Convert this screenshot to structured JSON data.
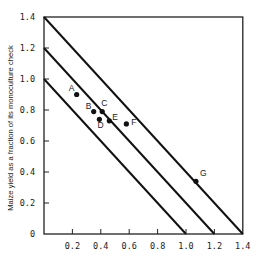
{
  "chart_data": {
    "type": "scatter",
    "title": "",
    "xlabel": "",
    "ylabel": "Maize yield as a fraction of its monoculture check",
    "xlim": [
      0,
      1.4
    ],
    "ylim": [
      0,
      1.4
    ],
    "grid": false,
    "legend": null,
    "x_ticks": [
      "0.2",
      "0.4",
      "0.6",
      "0.8",
      "1.0",
      "1.2",
      "1.4"
    ],
    "x_tick_values": [
      0.2,
      0.4,
      0.6,
      0.8,
      1.0,
      1.2,
      1.4
    ],
    "y_ticks": [
      "0",
      "0.2",
      "0.4",
      "0.6",
      "0.8",
      "1.0",
      "1.2",
      "1.4"
    ],
    "y_tick_values": [
      0,
      0.2,
      0.4,
      0.6,
      0.8,
      1.0,
      1.2,
      1.4
    ],
    "points": [
      {
        "label": "A",
        "x": 0.23,
        "y": 0.9
      },
      {
        "label": "B",
        "x": 0.35,
        "y": 0.79
      },
      {
        "label": "C",
        "x": 0.41,
        "y": 0.79
      },
      {
        "label": "D",
        "x": 0.39,
        "y": 0.74
      },
      {
        "label": "E",
        "x": 0.46,
        "y": 0.73
      },
      {
        "label": "F",
        "x": 0.58,
        "y": 0.71
      },
      {
        "label": "G",
        "x": 1.07,
        "y": 0.34
      }
    ],
    "reference_lines": [
      {
        "name": "x+y=1.0",
        "sum": 1.0
      },
      {
        "name": "x+y=1.2",
        "sum": 1.2
      },
      {
        "name": "x+y=1.4",
        "sum": 1.4
      }
    ],
    "label_offsets": {
      "A": [
        -8,
        -4
      ],
      "B": [
        -8,
        -3
      ],
      "C": [
        -1,
        -6
      ],
      "D": [
        -2,
        9
      ],
      "E": [
        3,
        -1
      ],
      "F": [
        5,
        1
      ],
      "G": [
        4,
        -5
      ]
    }
  }
}
